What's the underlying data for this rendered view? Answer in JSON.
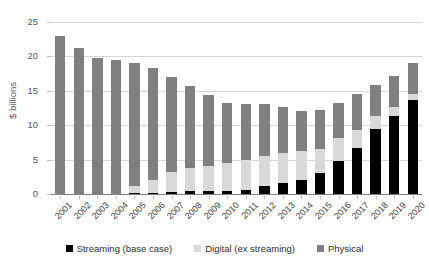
{
  "chart_data": {
    "type": "bar",
    "stacked": true,
    "title": "",
    "subtitle": "",
    "xlabel": "",
    "ylabel": "$ billions",
    "ylim": [
      0,
      25
    ],
    "yticks": [
      0,
      5,
      10,
      15,
      20,
      25
    ],
    "ytick_labels": [
      "0",
      "5",
      "10",
      "15",
      "20",
      "25"
    ],
    "grid": true,
    "legend_position": "bottom",
    "categories": [
      "2001",
      "2002",
      "2003",
      "2004",
      "2005",
      "2006",
      "2007",
      "2008",
      "2009",
      "2010",
      "2011",
      "2012",
      "2013",
      "2014",
      "2015",
      "2016",
      "2017",
      "2018",
      "2019",
      "2020"
    ],
    "series": [
      {
        "name": "Streaming (base case)",
        "color": "#000000",
        "values": [
          0,
          0,
          0,
          0,
          0.15,
          0.2,
          0.25,
          0.4,
          0.4,
          0.45,
          0.65,
          1.2,
          1.6,
          2.05,
          3.0,
          4.85,
          6.7,
          9.5,
          11.3,
          13.6
        ]
      },
      {
        "name": "Digital (ex streaming)",
        "color": "#d9d9d9",
        "values": [
          0,
          0,
          0,
          0.05,
          1.0,
          1.8,
          2.95,
          3.45,
          3.7,
          4.05,
          4.35,
          4.35,
          4.3,
          4.15,
          3.6,
          3.25,
          2.6,
          1.8,
          1.4,
          0.9
        ]
      },
      {
        "name": "Physical",
        "color": "#808080",
        "values": [
          22.95,
          21.2,
          19.75,
          19.5,
          17.85,
          16.3,
          13.8,
          11.85,
          10.3,
          8.8,
          8.1,
          7.6,
          6.7,
          5.8,
          5.6,
          5.2,
          5.2,
          4.5,
          4.4,
          4.5
        ]
      }
    ],
    "totals": [
      22.95,
      21.2,
      19.75,
      19.55,
      19.0,
      18.3,
      17.0,
      15.7,
      14.4,
      13.3,
      13.1,
      13.15,
      12.6,
      12.0,
      12.2,
      13.3,
      14.5,
      15.8,
      17.1,
      19.0
    ]
  },
  "legend": {
    "items": [
      {
        "label": "Streaming (base case)",
        "color": "#000000",
        "swatch_name": "legend-swatch-streaming"
      },
      {
        "label": "Digital (ex streaming)",
        "color": "#d9d9d9",
        "swatch_name": "legend-swatch-digital"
      },
      {
        "label": "Physical",
        "color": "#808080",
        "swatch_name": "legend-swatch-physical"
      }
    ]
  },
  "axes": {
    "y_title": "$ billions"
  },
  "colors": {
    "streaming": "#000000",
    "digital": "#d9d9d9",
    "physical": "#808080",
    "gridline": "#d6d6d6",
    "axis": "#808080",
    "text": "#3f3f3f",
    "background": "#ffffff"
  }
}
